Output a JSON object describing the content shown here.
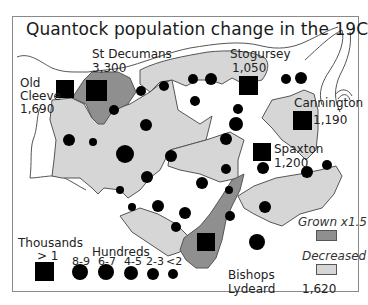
{
  "title": "Quantock population change in the 19C",
  "colors": {
    "grown": "#8f8f8f",
    "decreased": "#d6d6d6",
    "stable": "#ffffff",
    "marker": "#000000",
    "frame": "#8a8a8a"
  },
  "places": [
    {
      "name": "St Decumans",
      "value": "3,300"
    },
    {
      "name": "Old Cleeve",
      "name_line1": "Old",
      "name_line2": "Cleeve",
      "value": "1,690"
    },
    {
      "name": "Stogursey",
      "value": "1,050"
    },
    {
      "name": "Cannington",
      "value": "1,190"
    },
    {
      "name": "Spaxton",
      "value": "1,200"
    },
    {
      "name": "Bishops Lydeard",
      "name_line1": "Bishops",
      "name_line2": "Lydeard",
      "value": "1,620"
    }
  ],
  "legend": {
    "thousands_label": "Thousands",
    "thousands_range": "> 1",
    "hundreds_label": "Hundreds",
    "hundreds_ranges": [
      "8-9",
      "6-7",
      "4-5",
      "2-3",
      "<2"
    ],
    "grown_label": "Grown x1.5",
    "decreased_label": "Decreased"
  }
}
